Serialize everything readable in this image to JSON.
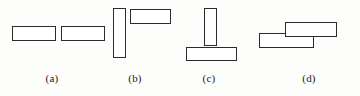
{
  "figure": {
    "type": "line-diagram",
    "background_color": "#fdfdfb",
    "stroke_color": "#2b2b2b",
    "fill_color": "#ffffff",
    "width": 360,
    "height": 96,
    "panels": [
      {
        "label": "(a)",
        "label_x": 52,
        "label_y": 72,
        "description": "two horizontal rectangles side by side, collinear",
        "shapes": [
          {
            "name": "rect-a-left",
            "x": 12,
            "y": 26,
            "w": 44,
            "h": 15,
            "orientation": "horizontal"
          },
          {
            "name": "rect-a-right",
            "x": 61,
            "y": 26,
            "w": 44,
            "h": 15,
            "orientation": "horizontal"
          }
        ]
      },
      {
        "label": "(b)",
        "label_x": 135,
        "label_y": 72,
        "description": "tall vertical rectangle with a horizontal rectangle at its upper right",
        "shapes": [
          {
            "name": "rect-b-vertical",
            "x": 113,
            "y": 8,
            "w": 13,
            "h": 50,
            "orientation": "vertical"
          },
          {
            "name": "rect-b-horizontal",
            "x": 130,
            "y": 9,
            "w": 41,
            "h": 15,
            "orientation": "horizontal"
          }
        ]
      },
      {
        "label": "(c)",
        "label_x": 209,
        "label_y": 72,
        "description": "vertical rectangle standing on a wider horizontal base rectangle, T shape inverted",
        "shapes": [
          {
            "name": "rect-c-vertical",
            "x": 204,
            "y": 8,
            "w": 13,
            "h": 38,
            "orientation": "vertical"
          },
          {
            "name": "rect-c-base",
            "x": 186,
            "y": 47,
            "w": 51,
            "h": 14,
            "orientation": "horizontal"
          }
        ]
      },
      {
        "label": "(d)",
        "label_x": 309,
        "label_y": 72,
        "description": "two horizontal rectangles overlapping, upper one offset right and above the lower one",
        "shapes": [
          {
            "name": "rect-d-upper",
            "x": 285,
            "y": 22,
            "w": 52,
            "h": 15,
            "orientation": "horizontal"
          },
          {
            "name": "rect-d-lower",
            "x": 259,
            "y": 33,
            "w": 55,
            "h": 15,
            "orientation": "horizontal"
          }
        ]
      }
    ]
  }
}
